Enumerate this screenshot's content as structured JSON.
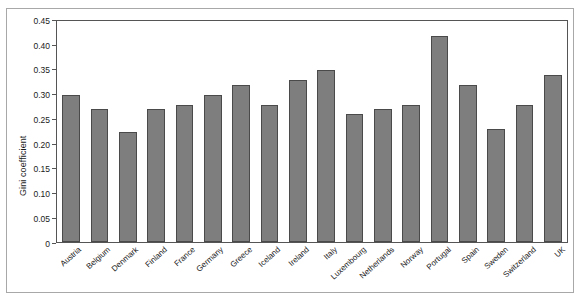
{
  "chart_data": {
    "type": "bar",
    "title": "",
    "xlabel": "",
    "ylabel": "Gini coefficient",
    "ylim": [
      0,
      0.45
    ],
    "ytick_labels": [
      "0.45",
      "0.40",
      "0.35",
      "0.30",
      "0.25",
      "0.20",
      "0.15",
      "0.10",
      "0.05",
      "0"
    ],
    "ytick_values": [
      0.45,
      0.4,
      0.35,
      0.3,
      0.25,
      0.2,
      0.15,
      0.1,
      0.05,
      0
    ],
    "grid": false,
    "legend": null,
    "bar_color": "#7e7e7e",
    "bar_edge_color": "#4a4a4a",
    "categories": [
      "Austria",
      "Belgium",
      "Denmark",
      "Finland",
      "France",
      "Germany",
      "Greece",
      "Iceland",
      "Ireland",
      "Italy",
      "Luxembourg",
      "Netherlands",
      "Norway",
      "Portugal",
      "Spain",
      "Sweden",
      "Switzerland",
      "UK"
    ],
    "values": [
      0.3,
      0.27,
      0.225,
      0.27,
      0.28,
      0.3,
      0.32,
      0.28,
      0.33,
      0.35,
      0.26,
      0.27,
      0.28,
      0.42,
      0.32,
      0.23,
      0.28,
      0.34
    ]
  }
}
